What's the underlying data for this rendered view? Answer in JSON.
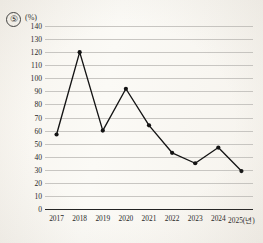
{
  "header": {
    "question_number": "⑤",
    "unit_label": "(%)"
  },
  "chart_data": {
    "type": "line",
    "title": "",
    "xlabel": "",
    "ylabel": "(%)",
    "categories": [
      "2017",
      "2018",
      "2019",
      "2020",
      "2021",
      "2022",
      "2023",
      "2024",
      "2025(년)"
    ],
    "x_tick_labels": [
      "2017",
      "2018",
      "2019",
      "2020",
      "2021",
      "2022",
      "2023",
      "2024",
      "2025(년)"
    ],
    "values": [
      57,
      120,
      60,
      92,
      64,
      43,
      35,
      47,
      29
    ],
    "series": [
      {
        "name": "",
        "values": [
          57,
          120,
          60,
          92,
          64,
          43,
          35,
          47,
          29
        ]
      }
    ],
    "ylim": [
      0,
      140
    ],
    "y_tick_step": 10,
    "y_tick_labels": [
      "0",
      "10",
      "20",
      "30",
      "40",
      "50",
      "60",
      "70",
      "80",
      "90",
      "100",
      "110",
      "120",
      "130",
      "140"
    ],
    "grid": true,
    "legend": "none",
    "marker": "filled-circle",
    "line_color": "#141414",
    "grid_color": "#c8c6c2",
    "axis_color": "#232323",
    "background_color": "#faf8f3"
  }
}
